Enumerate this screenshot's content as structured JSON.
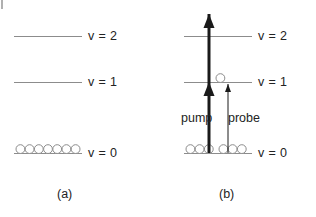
{
  "figure": {
    "width": 316,
    "height": 217,
    "background": "#ffffff",
    "line_color": "#8c8c8c",
    "arrow_color": "#1a1a1a",
    "text_color": "#232323",
    "circle_stroke": "#8c8c8c"
  },
  "panels": [
    {
      "id": "a",
      "caption": "(a)",
      "caption_x": 57,
      "caption_y": 188,
      "levels": [
        {
          "name": "v2",
          "label": "v = 2",
          "y": 36,
          "line_x1": 14,
          "line_x2": 82,
          "label_x": 88,
          "label_y": 30
        },
        {
          "name": "v1",
          "label": "v = 1",
          "y": 82,
          "line_x1": 14,
          "line_x2": 82,
          "label_x": 88,
          "label_y": 76
        },
        {
          "name": "v0",
          "label": "v = 0",
          "y": 153,
          "line_x1": 14,
          "line_x2": 82,
          "label_x": 88,
          "label_y": 147
        }
      ],
      "populations": [
        {
          "level": "v0",
          "count": 7,
          "start_x": 16,
          "spacing": 9.2,
          "radius": 4.4
        }
      ],
      "arrows": []
    },
    {
      "id": "b",
      "caption": "(b)",
      "caption_x": 219,
      "caption_y": 188,
      "levels": [
        {
          "name": "v2",
          "label": "v = 2",
          "y": 36,
          "line_x1": 184,
          "line_x2": 252,
          "label_x": 258,
          "label_y": 30
        },
        {
          "name": "v1",
          "label": "v = 1",
          "y": 82,
          "line_x1": 184,
          "line_x2": 252,
          "label_x": 258,
          "label_y": 76
        },
        {
          "name": "v0",
          "label": "v = 0",
          "y": 153,
          "line_x1": 184,
          "line_x2": 252,
          "label_x": 258,
          "label_y": 147
        }
      ],
      "populations": [
        {
          "level": "v0",
          "count": 3,
          "start_x": 186,
          "spacing": 9.2,
          "radius": 4.4
        },
        {
          "level": "v0",
          "count": 3,
          "start_x": 219,
          "spacing": 9.2,
          "radius": 4.4
        },
        {
          "level": "v1",
          "count": 1,
          "start_x": 216,
          "spacing": 9.2,
          "radius": 4.4
        }
      ],
      "arrows": [
        {
          "name": "pump-arrow",
          "label": "pump",
          "label_x": 181,
          "label_y": 112,
          "x": 209,
          "y_from": 153,
          "y_to": 14,
          "width": 3,
          "heads": [
            82,
            14
          ],
          "head_width": 11,
          "head_length": 14
        },
        {
          "name": "probe-arrow",
          "label": "probe",
          "label_x": 228,
          "label_y": 112,
          "x": 228,
          "y_from": 153,
          "y_to": 84,
          "width": 1,
          "heads": [
            84
          ],
          "head_width": 6,
          "head_length": 8
        }
      ]
    }
  ]
}
